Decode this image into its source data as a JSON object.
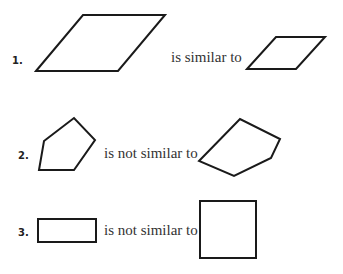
{
  "items": [
    {
      "number": "1.",
      "relation": "is similar to",
      "shape_a": "parallelogram-large",
      "shape_b": "parallelogram-small"
    },
    {
      "number": "2.",
      "relation": "is not similar to",
      "shape_a": "pentagon",
      "shape_b": "pentagon-distorted"
    },
    {
      "number": "3.",
      "relation": "is not similar to",
      "shape_a": "rectangle",
      "shape_b": "square"
    }
  ],
  "colors": {
    "stroke": "#1a1a1a",
    "text": "#333333",
    "background": "#ffffff"
  }
}
